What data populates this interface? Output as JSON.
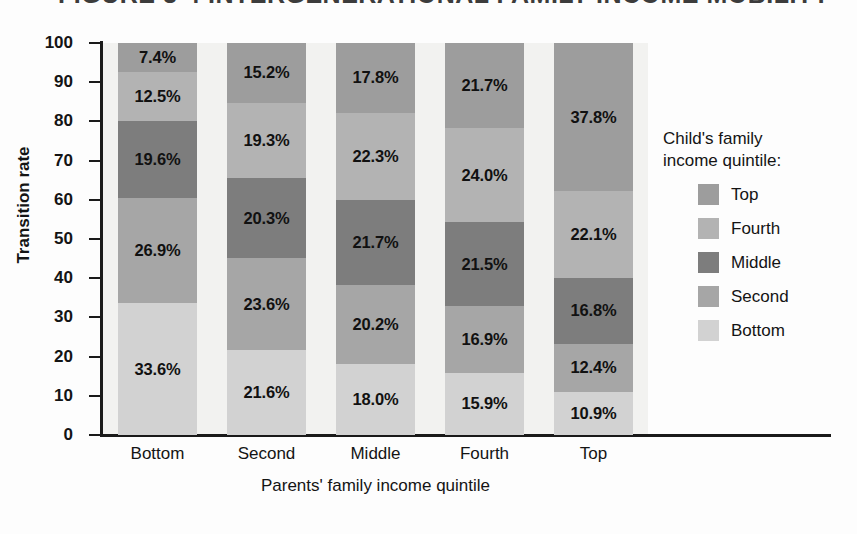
{
  "figure": {
    "title_remnant": "FIGURE 3-4  INTERGENERATIONAL FAMILY INCOME MOBILITY"
  },
  "legend": {
    "title_line1": "Child's family",
    "title_line2": "income quintile:",
    "entries": [
      {
        "label": "Top",
        "color": "#9d9d9d"
      },
      {
        "label": "Fourth",
        "color": "#b3b3b3"
      },
      {
        "label": "Middle",
        "color": "#7d7d7d"
      },
      {
        "label": "Second",
        "color": "#a6a6a6"
      },
      {
        "label": "Bottom",
        "color": "#d2d2d2"
      }
    ]
  },
  "chart_data": {
    "type": "bar",
    "subtype": "stacked-100-percent",
    "title": "FIGURE 3-4  INTERGENERATIONAL FAMILY INCOME MOBILITY",
    "xlabel": "Parents' family income quintile",
    "ylabel": "Transition rate",
    "ylim": [
      0,
      100
    ],
    "yticks": [
      0,
      10,
      20,
      30,
      40,
      50,
      60,
      70,
      80,
      90,
      100
    ],
    "ytick_labels": [
      "0",
      "10",
      "20",
      "30",
      "40",
      "50",
      "60",
      "70",
      "80",
      "90",
      "100"
    ],
    "grid": false,
    "legend_position": "right",
    "categories": [
      "Bottom",
      "Second",
      "Middle",
      "Fourth",
      "Top"
    ],
    "series": [
      {
        "name": "Bottom",
        "color": "#d2d2d2",
        "values": [
          33.6,
          21.6,
          18.0,
          15.9,
          10.9
        ],
        "labels": [
          "33.6%",
          "21.6%",
          "18.0%",
          "15.9%",
          "10.9%"
        ]
      },
      {
        "name": "Second",
        "color": "#a6a6a6",
        "values": [
          26.9,
          23.6,
          20.2,
          16.9,
          12.4
        ],
        "labels": [
          "26.9%",
          "23.6%",
          "20.2%",
          "16.9%",
          "12.4%"
        ]
      },
      {
        "name": "Middle",
        "color": "#7d7d7d",
        "values": [
          19.6,
          20.3,
          21.7,
          21.5,
          16.8
        ],
        "labels": [
          "19.6%",
          "20.3%",
          "21.7%",
          "21.5%",
          "16.8%"
        ]
      },
      {
        "name": "Fourth",
        "color": "#b3b3b3",
        "values": [
          12.5,
          19.3,
          22.3,
          24.0,
          22.1
        ],
        "labels": [
          "12.5%",
          "19.3%",
          "22.3%",
          "24.0%",
          "22.1%"
        ]
      },
      {
        "name": "Top",
        "color": "#9d9d9d",
        "values": [
          7.4,
          15.2,
          17.8,
          21.7,
          37.8
        ],
        "labels": [
          "7.4%",
          "15.2%",
          "17.8%",
          "21.7%",
          "37.8%"
        ]
      }
    ]
  }
}
